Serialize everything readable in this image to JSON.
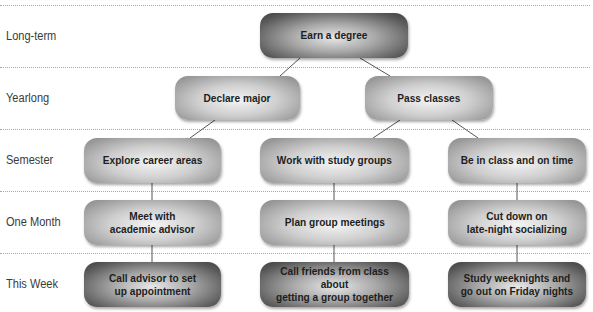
{
  "diagram": {
    "type": "goal-hierarchy-tree",
    "rows": [
      {
        "label": "Long-term",
        "y_center": 36
      },
      {
        "label": "Yearlong",
        "y_center": 98
      },
      {
        "label": "Semester",
        "y_center": 160
      },
      {
        "label": "One Month",
        "y_center": 222
      },
      {
        "label": "This Week",
        "y_center": 284
      }
    ],
    "nodes": {
      "earn_degree": {
        "text": "Earn a degree",
        "row": "Long-term"
      },
      "declare_major": {
        "text": "Declare major",
        "row": "Yearlong"
      },
      "pass_classes": {
        "text": "Pass classes",
        "row": "Yearlong"
      },
      "explore_career": {
        "text": "Explore career areas",
        "row": "Semester"
      },
      "study_groups": {
        "text": "Work with study groups",
        "row": "Semester"
      },
      "in_class": {
        "text": "Be in class and on time",
        "row": "Semester"
      },
      "meet_advisor": {
        "text": "Meet with\nacademic advisor",
        "row": "One Month"
      },
      "plan_meetings": {
        "text": "Plan group meetings",
        "row": "One Month"
      },
      "cut_socializing": {
        "text": "Cut down on\nlate-night socializing",
        "row": "One Month"
      },
      "call_advisor": {
        "text": "Call advisor to set\nup appointment",
        "row": "This Week"
      },
      "call_friends": {
        "text": "Call friends from class about\ngetting a group together",
        "row": "This Week"
      },
      "study_weeknights": {
        "text": "Study weeknights and\ngo out on Friday nights",
        "row": "This Week"
      }
    },
    "edges": [
      [
        "earn_degree",
        "declare_major"
      ],
      [
        "earn_degree",
        "pass_classes"
      ],
      [
        "declare_major",
        "explore_career"
      ],
      [
        "pass_classes",
        "study_groups"
      ],
      [
        "pass_classes",
        "in_class"
      ],
      [
        "explore_career",
        "meet_advisor"
      ],
      [
        "meet_advisor",
        "call_advisor"
      ],
      [
        "study_groups",
        "plan_meetings"
      ],
      [
        "plan_meetings",
        "call_friends"
      ],
      [
        "in_class",
        "cut_socializing"
      ],
      [
        "cut_socializing",
        "study_weeknights"
      ]
    ],
    "colors": {
      "mid_node": "#b5b5b5",
      "dark_node": "#5a5a5a",
      "separator": "#a8a8a8",
      "connector": "#555555"
    }
  }
}
